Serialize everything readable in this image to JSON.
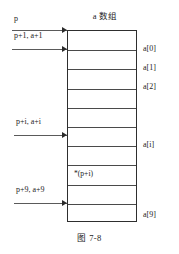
{
  "figure": {
    "array_title": "a 数组",
    "caption": "图 7-8"
  },
  "pointers": [
    {
      "label": "p",
      "target_y": 30,
      "label_y": 14,
      "label_x": 14,
      "line_x": 12,
      "line_w": 55
    },
    {
      "label": "p+1, a+1",
      "target_y": 49,
      "label_y": 31,
      "label_x": 14,
      "line_x": 12,
      "line_w": 55
    },
    {
      "label": "p+i, a+i",
      "target_y": 135,
      "label_y": 117,
      "label_x": 16,
      "line_x": 14,
      "line_w": 53
    },
    {
      "label": "p+9, a+9",
      "target_y": 203,
      "label_y": 185,
      "label_x": 16,
      "line_x": 14,
      "line_w": 53
    }
  ],
  "cells": [
    {
      "index": 0,
      "content": "",
      "index_label": "a[0]",
      "divider_y": 19.2,
      "label_y": 44
    },
    {
      "index": 1,
      "content": "",
      "index_label": "a[1]",
      "divider_y": 38.4,
      "label_y": 63
    },
    {
      "index": 2,
      "content": "",
      "index_label": "a[2]",
      "divider_y": 57.6,
      "label_y": 82
    },
    {
      "index": 3,
      "content": "",
      "index_label": "",
      "divider_y": 76.8,
      "label_y": 0
    },
    {
      "index": 4,
      "content": "",
      "index_label": "",
      "divider_y": 96.0,
      "label_y": 0
    },
    {
      "index": 5,
      "content": "",
      "index_label": "",
      "divider_y": 115.2,
      "label_y": 0
    },
    {
      "index": 6,
      "content": "*(p+i)",
      "index_label": "a[i]",
      "divider_y": 134.4,
      "label_y": 140,
      "content_y": 138
    },
    {
      "index": 7,
      "content": "",
      "index_label": "",
      "divider_y": 153.6,
      "label_y": 0
    },
    {
      "index": 8,
      "content": "",
      "index_label": "",
      "divider_y": 172.8,
      "label_y": 0
    },
    {
      "index": 9,
      "content": "",
      "index_label": "a[9]",
      "divider_y": 192.0,
      "label_y": 210
    }
  ],
  "colors": {
    "box_border": "#2e2e2e",
    "divider": "#4a4a4a",
    "arrow": "#2b2b2b",
    "text": "#1c1c1c",
    "background": "#ffffff"
  }
}
